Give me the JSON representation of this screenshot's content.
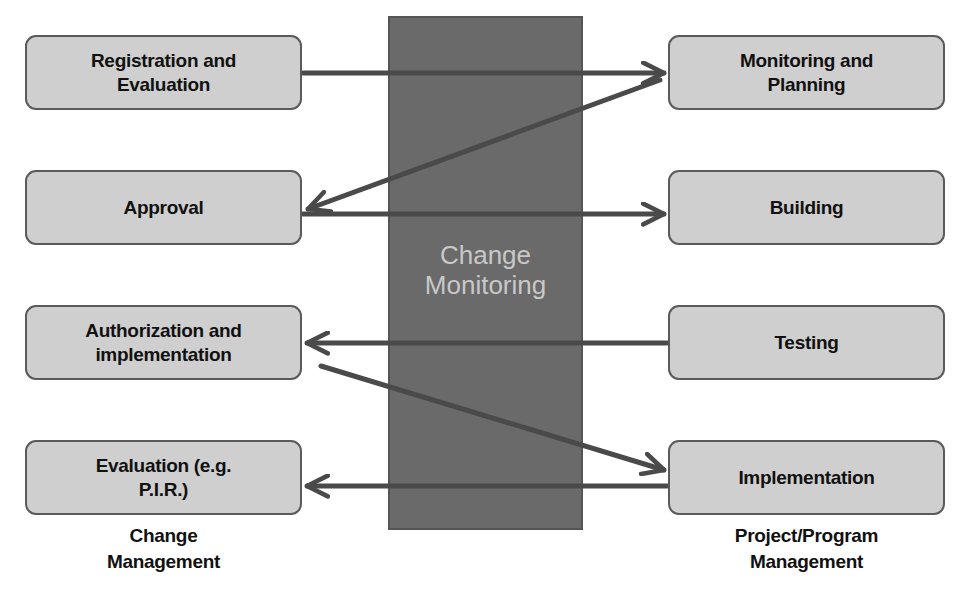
{
  "diagram": {
    "center": {
      "label_line1": "Change",
      "label_line2": "Monitoring",
      "fill_color": "#6a6a6a",
      "text_color": "#c8c8c8"
    },
    "left_column": {
      "caption_line1": "Change",
      "caption_line2": "Management",
      "boxes": [
        {
          "line1": "Registration and",
          "line2": "Evaluation"
        },
        {
          "line1": "Approval",
          "line2": ""
        },
        {
          "line1": "Authorization and",
          "line2": "implementation"
        },
        {
          "line1": "Evaluation (e.g.",
          "line2": "P.I.R.)"
        }
      ]
    },
    "right_column": {
      "caption_line1": "Project/Program",
      "caption_line2": "Management",
      "boxes": [
        {
          "line1": "Monitoring and",
          "line2": "Planning"
        },
        {
          "line1": "Building",
          "line2": ""
        },
        {
          "line1": "Testing",
          "line2": ""
        },
        {
          "line1": "Implementation",
          "line2": ""
        }
      ]
    },
    "arrows": [
      {
        "from": "Registration and Evaluation",
        "to": "Monitoring and Planning",
        "direction": "left-to-right"
      },
      {
        "from": "Monitoring and Planning",
        "to": "Approval",
        "direction": "right-to-left-diagonal"
      },
      {
        "from": "Approval",
        "to": "Building",
        "direction": "left-to-right"
      },
      {
        "from": "Testing",
        "to": "Authorization and implementation",
        "direction": "right-to-left"
      },
      {
        "from": "Authorization and implementation",
        "to": "Implementation",
        "direction": "left-to-right-diagonal"
      },
      {
        "from": "Implementation",
        "to": "Evaluation (e.g. P.I.R.)",
        "direction": "right-to-left"
      }
    ],
    "colors": {
      "box_fill": "#cfcfcf",
      "box_border": "#5a5a5a",
      "arrow": "#4a4a4a"
    }
  }
}
